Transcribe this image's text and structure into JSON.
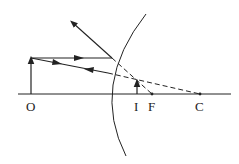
{
  "diagram": {
    "type": "convex-mirror-ray-diagram",
    "labels": {
      "object": "O",
      "image": "I",
      "focus": "F",
      "center": "C"
    },
    "colors": {
      "line": "#222222",
      "background": "#ffffff"
    }
  }
}
